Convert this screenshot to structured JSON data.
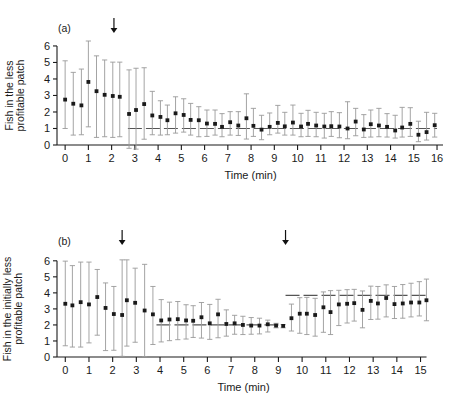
{
  "figure": {
    "background": "#ffffff",
    "marker_color": "#1a1a1a",
    "errorbar_color": "#9a9a9a",
    "reference_line_color": "#555555",
    "arrow_color": "#111111"
  },
  "panels": [
    {
      "id": "a",
      "label": "(a)",
      "xlabel": "Time (min)",
      "ylabel_line1": "Fish in the less",
      "ylabel_line2": "profitable patch",
      "xticks": [
        0,
        1,
        2,
        3,
        4,
        5,
        6,
        7,
        8,
        9,
        10,
        11,
        12,
        13,
        14,
        15,
        16
      ],
      "yticks": [
        0,
        1,
        2,
        3,
        4,
        5,
        6
      ],
      "xlim": [
        -0.35,
        16.3
      ],
      "ylim": [
        0,
        6.3
      ],
      "arrows": [
        2.1
      ],
      "reference_lines": [
        {
          "y": 1.0,
          "x_start": 2.7,
          "x_end": 16.0
        }
      ],
      "chart_data": {
        "type": "scatter",
        "title": "",
        "xlabel": "Time (min)",
        "ylabel": "Fish in the less profitable patch",
        "xlim": [
          -0.35,
          16.3
        ],
        "ylim": [
          0,
          6.3
        ],
        "grid": false,
        "legend": "none",
        "series": [
          {
            "name": "median fish in less profitable patch",
            "x": [
              0.0,
              0.35,
              0.7,
              1.0,
              1.35,
              1.7,
              2.05,
              2.35,
              2.75,
              3.05,
              3.4,
              3.75,
              4.1,
              4.4,
              4.75,
              5.1,
              5.4,
              5.75,
              6.1,
              6.45,
              6.75,
              7.1,
              7.45,
              7.8,
              8.1,
              8.45,
              8.8,
              9.15,
              9.45,
              9.8,
              10.15,
              10.45,
              10.8,
              11.15,
              11.45,
              11.8,
              12.15,
              12.5,
              12.85,
              13.15,
              13.5,
              13.85,
              14.2,
              14.5,
              14.85,
              15.2,
              15.55,
              15.9
            ],
            "y": [
              2.75,
              2.5,
              2.4,
              3.82,
              3.26,
              3.04,
              2.97,
              2.92,
              1.88,
              2.12,
              2.48,
              1.79,
              1.7,
              1.5,
              1.92,
              1.82,
              1.52,
              1.5,
              1.3,
              1.28,
              1.1,
              1.38,
              1.18,
              1.62,
              1.16,
              0.93,
              1.1,
              1.34,
              1.13,
              1.36,
              1.12,
              1.28,
              1.18,
              1.12,
              1.14,
              1.12,
              1.0,
              1.42,
              0.94,
              1.26,
              1.18,
              1.1,
              0.88,
              1.06,
              1.28,
              0.62,
              0.78,
              1.2,
              1.04
            ],
            "yerr_low": [
              1.0,
              0.6,
              0.62,
              1.1,
              0.46,
              0.5,
              0.46,
              0.5,
              -0.2,
              -0.3,
              0.35,
              0.62,
              0.6,
              0.62,
              0.72,
              0.78,
              0.6,
              0.5,
              0.52,
              0.6,
              0.5,
              0.6,
              0.58,
              0.36,
              0.52,
              0.32,
              0.62,
              0.72,
              0.6,
              0.6,
              0.5,
              0.52,
              0.5,
              0.42,
              0.52,
              0.44,
              0.38,
              0.56,
              0.46,
              0.48,
              0.5,
              0.48,
              0.42,
              0.48,
              0.52,
              0.2,
              0.3,
              0.48,
              0.4
            ],
            "yerr_high": [
              5.1,
              4.4,
              4.6,
              6.3,
              5.4,
              5.15,
              5.02,
              5.02,
              4.55,
              4.65,
              4.68,
              3.25,
              2.68,
              2.42,
              2.92,
              2.8,
              2.52,
              2.32,
              2.12,
              2.12,
              1.9,
              2.02,
              2.02,
              3.1,
              2.22,
              1.8,
              1.94,
              2.4,
              1.98,
              2.42,
              1.92,
              2.1,
              1.98,
              1.92,
              2.02,
              1.96,
              2.62,
              2.22,
              1.84,
              2.12,
              2.22,
              1.9,
              1.8,
              2.28,
              2.26,
              1.44,
              1.98,
              1.92,
              1.72
            ]
          }
        ]
      }
    },
    {
      "id": "b",
      "label": "(b)",
      "xlabel": "Time (min)",
      "ylabel_line1": "Fish in the initially less",
      "ylabel_line2": "profitable patch",
      "xticks": [
        0,
        1,
        2,
        3,
        4,
        5,
        6,
        7,
        8,
        9,
        10,
        11,
        12,
        13,
        14,
        15
      ],
      "yticks": [
        0,
        1,
        2,
        3,
        4,
        5,
        6
      ],
      "xlim": [
        -0.35,
        15.4
      ],
      "ylim": [
        0,
        6.3
      ],
      "arrows": [
        2.4,
        9.3
      ],
      "reference_lines": [
        {
          "y": 2.0,
          "x_start": 3.85,
          "x_end": 9.25
        },
        {
          "y": 3.85,
          "x_start": 9.3,
          "x_end": 15.25
        }
      ],
      "chart_data": {
        "type": "scatter",
        "title": "",
        "xlabel": "Time (min)",
        "ylabel": "Fish in the initially less profitable patch",
        "xlim": [
          -0.35,
          15.4
        ],
        "ylim": [
          0,
          6.3
        ],
        "grid": false,
        "legend": "none",
        "series": [
          {
            "name": "median fish in initially less profitable patch",
            "x": [
              0.0,
              0.3,
              0.65,
              1.0,
              1.35,
              1.7,
              2.05,
              2.4,
              2.6,
              2.95,
              3.35,
              3.7,
              4.05,
              4.4,
              4.75,
              5.1,
              5.4,
              5.75,
              6.1,
              6.45,
              6.8,
              7.15,
              7.5,
              7.85,
              8.2,
              8.55,
              8.9,
              9.2,
              9.55,
              9.9,
              10.2,
              10.55,
              10.9,
              11.2,
              11.55,
              11.9,
              12.2,
              12.55,
              12.9,
              13.2,
              13.55,
              13.9,
              14.25,
              14.6,
              14.95,
              15.25
            ],
            "y": [
              3.32,
              3.22,
              3.42,
              3.28,
              3.74,
              3.06,
              2.68,
              2.62,
              3.54,
              3.38,
              2.9,
              2.66,
              2.28,
              2.34,
              2.36,
              2.28,
              2.26,
              2.48,
              2.1,
              2.66,
              2.06,
              2.1,
              2.0,
              1.96,
              1.96,
              2.04,
              1.96,
              1.94,
              2.42,
              2.7,
              2.7,
              2.62,
              3.1,
              2.8,
              3.28,
              3.32,
              3.36,
              2.94,
              3.5,
              3.34,
              3.68,
              3.3,
              3.34,
              3.4,
              3.4,
              3.54
            ],
            "yerr_low": [
              0.7,
              0.62,
              0.62,
              0.88,
              1.36,
              0.4,
              0.42,
              0.04,
              0.68,
              0.92,
              0.02,
              0.78,
              0.94,
              1.02,
              1.08,
              1.12,
              1.22,
              1.18,
              1.1,
              1.2,
              1.3,
              1.42,
              1.4,
              1.42,
              1.44,
              1.56,
              1.82,
              1.82,
              1.62,
              1.48,
              1.4,
              1.3,
              1.54,
              1.4,
              1.96,
              2.12,
              2.24,
              1.82,
              2.34,
              2.36,
              2.5,
              2.4,
              2.42,
              2.5,
              2.56,
              2.26
            ],
            "yerr_high": [
              5.98,
              5.7,
              5.92,
              5.92,
              5.46,
              4.62,
              4.4,
              6.06,
              6.06,
              5.54,
              5.78,
              4.4,
              3.58,
              3.42,
              3.46,
              3.26,
              3.2,
              3.4,
              3.28,
              3.6,
              2.94,
              2.6,
              2.54,
              2.46,
              2.42,
              2.3,
              2.1,
              2.02,
              3.3,
              3.7,
              3.72,
              3.66,
              4.06,
              4.14,
              4.16,
              4.2,
              4.22,
              4.12,
              4.42,
              4.4,
              4.5,
              4.4,
              4.52,
              4.6,
              4.7,
              4.86
            ]
          }
        ]
      }
    }
  ]
}
